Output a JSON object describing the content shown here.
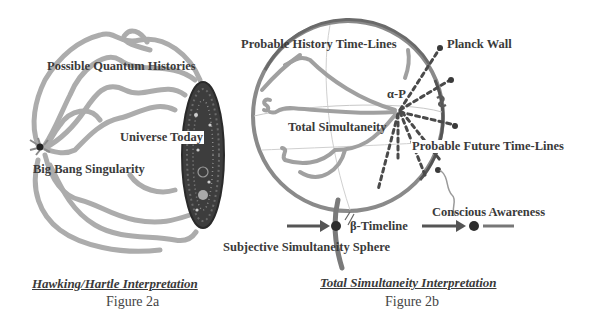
{
  "figure_a": {
    "labels": {
      "possible_quantum_histories": "Possible Quantum Histories",
      "universe_today": "Universe Today",
      "big_bang_singularity": "Big Bang Singularity"
    },
    "caption_title": "Hawking/Hartle Interpretation",
    "caption_figure": "Figure 2a"
  },
  "figure_b": {
    "labels": {
      "probable_history_time_lines": "Probable History Time-Lines",
      "planck_wall": "Planck Wall",
      "alpha_p": "α-P",
      "total_simultaneity": "Total Simultaneity",
      "probable_future_time_lines": "Probable Future Time-Lines",
      "beta_timeline": "β-Timeline",
      "conscious_awareness": "Conscious Awareness",
      "subjective_simultaneity_sphere": "Subjective Simultaneity Sphere"
    },
    "caption_title": "Total Simultaneity Interpretation",
    "caption_figure": "Figure 2b"
  },
  "colors": {
    "stroke_light": "#a8a8a8",
    "stroke_dark": "#5a5a5a",
    "ellipse_fill": "#3d3d3d",
    "text": "#3a3a3a"
  }
}
